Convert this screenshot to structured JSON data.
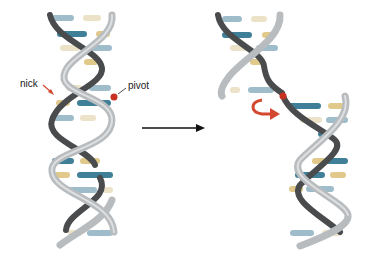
{
  "diagram": {
    "labels": {
      "nick": "nick",
      "pivot": "pivot"
    },
    "panels": [
      {
        "name": "intact-dna-helix",
        "state": "before"
      },
      {
        "name": "nicked-dna-helix",
        "state": "after"
      }
    ],
    "colors": {
      "backbone_light": "#b9bcbf",
      "backbone_dark": "#4a4b4d",
      "base_dark_teal": "#3f7f97",
      "base_light_blue": "#9fbccb",
      "base_tan": "#e0c98a",
      "base_cream": "#ece2c8",
      "pivot_dot": "#c8301f",
      "rotation_arrow": "#d2492f",
      "nick_arrow": "#d2492f",
      "transition_arrow": "#111111"
    }
  }
}
